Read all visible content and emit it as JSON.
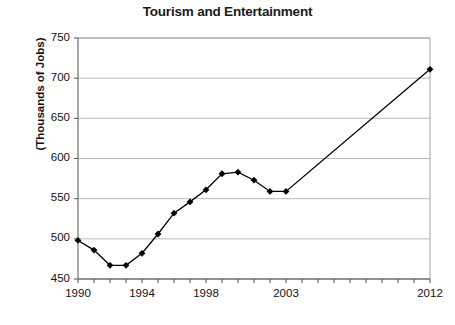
{
  "chart_data": {
    "type": "line",
    "title": "Tourism and Entertainment",
    "xlabel": "",
    "ylabel": "(Thousands of Jobs)",
    "xlim": [
      1990,
      2012
    ],
    "ylim": [
      450,
      750
    ],
    "ytick_labels": [
      "750",
      "700",
      "650",
      "600",
      "550",
      "500",
      "450"
    ],
    "ytick_values": [
      750,
      700,
      650,
      600,
      550,
      500,
      450
    ],
    "xtick_labels": [
      "1990",
      "1994",
      "1998",
      "2003",
      "2012"
    ],
    "xtick_values": [
      1990,
      1994,
      1998,
      2003,
      2012
    ],
    "x_minor_ticks_every": 1,
    "grid": "horizontal",
    "legend": "none",
    "marker": "diamond",
    "line_color": "#000000",
    "marker_color": "#000000",
    "grid_color": "#b0b0b0",
    "axis_color": "#808080",
    "background": "#ffffff",
    "x": [
      1990,
      1991,
      1992,
      1993,
      1994,
      1995,
      1996,
      1997,
      1998,
      1999,
      2000,
      2001,
      2002,
      2003,
      2012
    ],
    "values": [
      498,
      486,
      467,
      467,
      482,
      506,
      532,
      546,
      561,
      581,
      583,
      573,
      559,
      559,
      711
    ],
    "points": [
      {
        "year": 1990,
        "value": 498
      },
      {
        "year": 1991,
        "value": 486
      },
      {
        "year": 1992,
        "value": 467
      },
      {
        "year": 1993,
        "value": 467
      },
      {
        "year": 1994,
        "value": 482
      },
      {
        "year": 1995,
        "value": 506
      },
      {
        "year": 1996,
        "value": 532
      },
      {
        "year": 1997,
        "value": 546
      },
      {
        "year": 1998,
        "value": 561
      },
      {
        "year": 1999,
        "value": 581
      },
      {
        "year": 2000,
        "value": 583
      },
      {
        "year": 2001,
        "value": 573
      },
      {
        "year": 2002,
        "value": 559
      },
      {
        "year": 2003,
        "value": 559
      },
      {
        "year": 2012,
        "value": 711
      }
    ]
  }
}
